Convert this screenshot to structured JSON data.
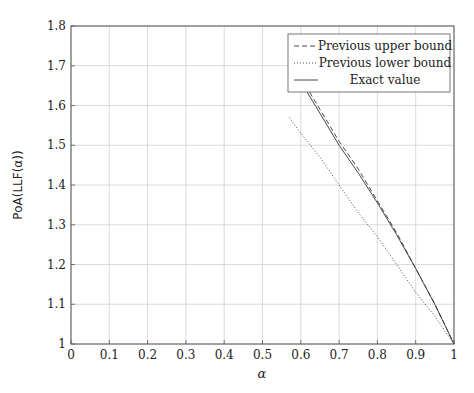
{
  "chart_data": {
    "type": "line",
    "title": "",
    "xlabel": "α",
    "ylabel": "PoA(LLF(α))",
    "xlim": [
      0,
      1
    ],
    "ylim": [
      1,
      1.8
    ],
    "grid": true,
    "legend_position": "upper right",
    "x_ticks": [
      "0",
      "0.1",
      "0.2",
      "0.3",
      "0.4",
      "0.5",
      "0.6",
      "0.7",
      "0.8",
      "0.9",
      "1"
    ],
    "y_ticks": [
      "1",
      "1.1",
      "1.2",
      "1.3",
      "1.4",
      "1.5",
      "1.6",
      "1.7",
      "1.8"
    ],
    "series": [
      {
        "name": "Previous upper bound",
        "style": "dashed",
        "x": [
          0.57,
          0.6,
          0.65,
          0.7,
          0.75,
          0.8,
          0.85,
          0.9,
          0.95,
          1.0
        ],
        "y": [
          1.72,
          1.67,
          1.59,
          1.51,
          1.44,
          1.36,
          1.28,
          1.19,
          1.1,
          1.0
        ]
      },
      {
        "name": "Previous lower bound",
        "style": "dotted",
        "x": [
          0.57,
          0.6,
          0.65,
          0.7,
          0.75,
          0.8,
          0.85,
          0.9,
          0.95,
          1.0
        ],
        "y": [
          1.57,
          1.53,
          1.47,
          1.4,
          1.33,
          1.27,
          1.2,
          1.13,
          1.07,
          1.0
        ]
      },
      {
        "name": "Exact value",
        "style": "solid",
        "x": [
          0.57,
          0.6,
          0.65,
          0.7,
          0.75,
          0.8,
          0.85,
          0.9,
          0.95,
          1.0
        ],
        "y": [
          1.71,
          1.66,
          1.58,
          1.5,
          1.43,
          1.355,
          1.275,
          1.19,
          1.1,
          1.0
        ]
      }
    ]
  }
}
